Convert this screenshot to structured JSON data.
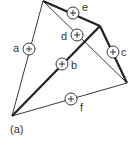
{
  "figure": {
    "caption": "(a)",
    "vertices": {
      "top": [
        43,
        1
      ],
      "left_bottom": [
        12,
        116
      ],
      "right": [
        127,
        83
      ],
      "junction": [
        100,
        26
      ]
    },
    "edges": [
      {
        "id": "a",
        "label": "a",
        "from": "top",
        "to": "left_bottom",
        "weight": "thin"
      },
      {
        "id": "e",
        "label": "e",
        "from": "top",
        "to": "junction",
        "weight": "thick"
      },
      {
        "id": "d",
        "label": "d",
        "from": "top",
        "to": "right",
        "weight": "thin"
      },
      {
        "id": "c",
        "label": "c",
        "from": "junction",
        "to": "right",
        "weight": "thick"
      },
      {
        "id": "b",
        "label": "b",
        "from": "left_bottom",
        "to": "junction",
        "weight": "thick"
      },
      {
        "id": "f",
        "label": "f",
        "from": "left_bottom",
        "to": "right",
        "weight": "thin"
      }
    ],
    "node_symbol": "+",
    "colors": {
      "line": "#222222",
      "text": "#333333",
      "background": "#ffffff"
    }
  }
}
